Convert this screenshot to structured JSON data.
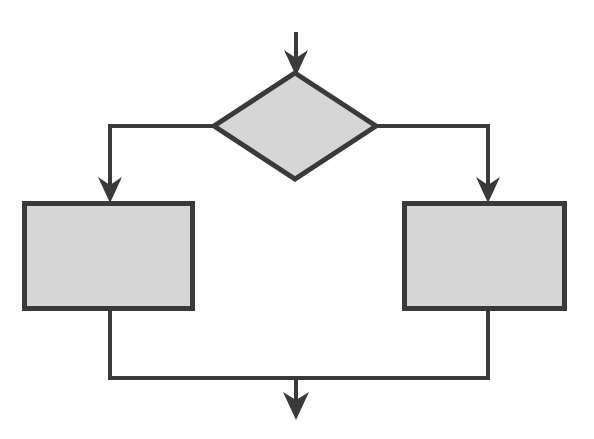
{
  "canvas": {
    "width": 594,
    "height": 439,
    "background_color": "#ffffff"
  },
  "style": {
    "shape_fill_color": "#d6d6d6",
    "stroke_color": "#3a3a3a",
    "shape_stroke_width": 5,
    "connector_stroke_width": 4
  },
  "diagram": {
    "type": "flowchart",
    "title": "",
    "pattern": "if-then-else branch and merge",
    "node_count": 3,
    "nodes": [
      {
        "id": "decision",
        "name": "decision-diamond",
        "shape": "diamond",
        "label": "",
        "center_x": 295,
        "center_y": 125,
        "half_width": 81,
        "half_height": 53,
        "fill": "#d6d6d6"
      },
      {
        "id": "branch-left",
        "name": "process-box-left",
        "shape": "rectangle",
        "label": "",
        "x": 22,
        "y": 201,
        "width": 173,
        "height": 110,
        "fill": "#d6d6d6"
      },
      {
        "id": "branch-right",
        "name": "process-box-right",
        "shape": "rectangle",
        "label": "",
        "x": 402,
        "y": 201,
        "width": 165,
        "height": 110,
        "fill": "#d6d6d6"
      }
    ],
    "connectors": [
      {
        "id": "entry",
        "name": "entry-arrow",
        "label": "",
        "from": "start",
        "to": "decision",
        "path": "M 296 32 L 296 72",
        "arrow": "end"
      },
      {
        "id": "branch-left-link",
        "name": "decision-to-left-box-connector",
        "label": "",
        "from": "decision",
        "to": "branch-left",
        "path": "M 214 126 L 110 126 L 110 199",
        "arrow": "end"
      },
      {
        "id": "branch-right-link",
        "name": "decision-to-right-box-connector",
        "label": "",
        "from": "decision",
        "to": "branch-right",
        "path": "M 376 126 L 488 126 L 488 199",
        "arrow": "end"
      },
      {
        "id": "merge-left-link",
        "name": "left-box-to-merge-connector",
        "label": "",
        "from": "branch-left",
        "to": "merge",
        "path": "M 110 311 L 110 378 L 296 378",
        "arrow": "none"
      },
      {
        "id": "merge-right-link",
        "name": "right-box-to-merge-connector",
        "label": "",
        "from": "branch-right",
        "to": "merge",
        "path": "M 488 311 L 488 378 L 296 378",
        "arrow": "none"
      },
      {
        "id": "exit",
        "name": "exit-arrow",
        "label": "",
        "from": "merge",
        "to": "end",
        "path": "M 296 378 L 296 410",
        "arrow": "end"
      }
    ]
  }
}
